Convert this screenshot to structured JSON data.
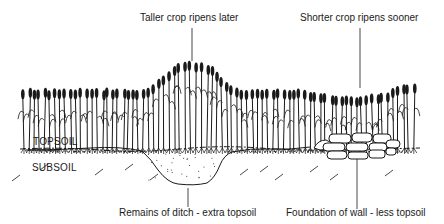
{
  "diagram": {
    "labels": {
      "taller_crop": "Taller crop ripens later",
      "shorter_crop": "Shorter crop ripens sooner",
      "ditch": "Remains of ditch - extra topsoil",
      "wall": "Foundation of wall - less topsoil"
    },
    "layers": {
      "topsoil": "TOPSOIL",
      "subsoil": "SUBSOIL"
    },
    "colors": {
      "ink": "#1a1a1a",
      "background": "#ffffff"
    }
  }
}
